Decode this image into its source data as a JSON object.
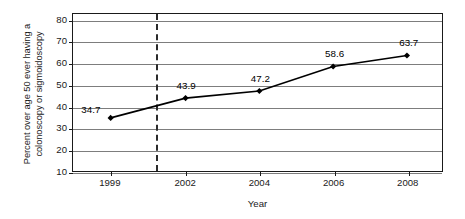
{
  "chart_data": {
    "type": "line",
    "title": "",
    "xlabel": "Year",
    "ylabel": "Percent over age 50 ever having a colonoscopy or sigmoidoscopy",
    "ylabel_lines": [
      "Percent over age 50 ever having a",
      "colonoscopy or sigmoidoscopy"
    ],
    "categories": [
      "1999",
      "2002",
      "2004",
      "2006",
      "2008"
    ],
    "values": [
      34.7,
      43.9,
      47.2,
      58.6,
      63.7
    ],
    "data_labels": [
      "34.7",
      "43.9",
      "47.2",
      "58.6",
      "63.7"
    ],
    "series": [
      {
        "name": "",
        "values": [
          34.7,
          43.9,
          47.2,
          58.6,
          63.7
        ],
        "color": "#000000",
        "marker": "diamond"
      }
    ],
    "ylim": [
      10,
      83
    ],
    "yticks": [
      10,
      20,
      30,
      40,
      50,
      60,
      70,
      80
    ],
    "ytick_labels": [
      "10",
      "20",
      "30",
      "40",
      "50",
      "60",
      "70",
      "80"
    ],
    "xtick_labels": [
      "1999",
      "2002",
      "2004",
      "2006",
      "2008"
    ],
    "xtick_positions_frac": [
      0.102,
      0.305,
      0.505,
      0.705,
      0.905
    ],
    "grid": "horizontal",
    "legend": "none",
    "annotations": [
      {
        "name": "reference-line",
        "type": "vertical-dashed-line",
        "position_frac": 0.223,
        "color": "#2b2b2b"
      }
    ],
    "label_offsets": [
      {
        "dx": -20,
        "dy": -9
      },
      {
        "dx": 0,
        "dy": -13
      },
      {
        "dx": 0,
        "dy": -13
      },
      {
        "dx": 0,
        "dy": -13
      },
      {
        "dx": 0,
        "dy": -13
      }
    ],
    "colors": {
      "line": "#000000",
      "marker": "#000000",
      "gridline": "#7d7d7d",
      "axis": "#1a1a1a",
      "reference_line": "#2b2b2b",
      "background": "#ffffff"
    }
  }
}
